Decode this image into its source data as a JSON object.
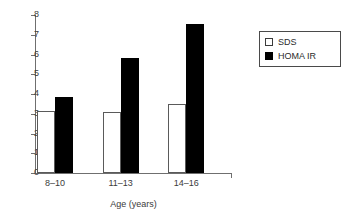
{
  "chart_data": {
    "type": "bar",
    "title": "",
    "subtitle": "",
    "xlabel": "Age (years)",
    "ylabel": "",
    "categories": [
      "8–10",
      "11–13",
      "14–16"
    ],
    "series": [
      {
        "name": "SDS",
        "values": [
          3.15,
          3.1,
          3.5
        ],
        "color": "#ffffff",
        "edge_color": "#5a5a5a"
      },
      {
        "name": "HOMA IR",
        "values": [
          3.85,
          5.8,
          7.55
        ],
        "color": "#000000",
        "edge_color": "#000000"
      }
    ],
    "ylim": [
      0,
      8
    ],
    "ytick_labels": [
      "8",
      "7",
      "6",
      "5",
      "4",
      "3",
      "2",
      "1",
      "0"
    ],
    "ytick_values": [
      8,
      7,
      6,
      5,
      4,
      3,
      2,
      1,
      0
    ],
    "grid": false,
    "legend_position": "right",
    "axis_color": "#6f6f6f",
    "text_color": "#3b3b3b"
  },
  "legend": {
    "entries": [
      {
        "label": "SDS",
        "swatch": "open-square-swatch"
      },
      {
        "label": "HOMA IR",
        "swatch": "filled-square-swatch"
      }
    ]
  }
}
